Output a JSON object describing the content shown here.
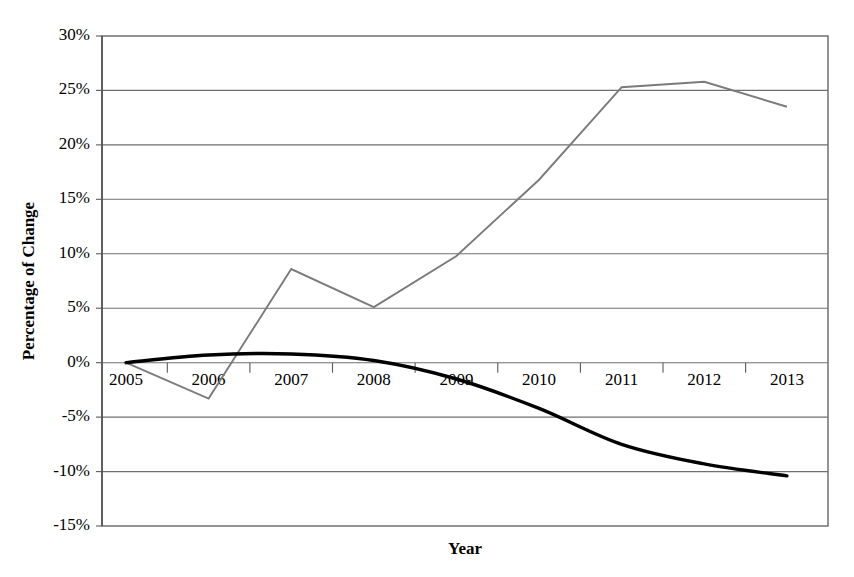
{
  "chart_data": {
    "type": "line",
    "title": "",
    "xlabel": "Year",
    "ylabel": "Percentage of Change",
    "categories": [
      "2005",
      "2006",
      "2007",
      "2008",
      "2009",
      "2010",
      "2011",
      "2012",
      "2013"
    ],
    "x": [
      2005,
      2006,
      2007,
      2008,
      2009,
      2010,
      2011,
      2012,
      2013
    ],
    "series": [
      {
        "name": "gray-series",
        "color": "#7b7b7b",
        "style": "straight",
        "values": [
          0.0,
          -3.3,
          8.6,
          5.1,
          9.8,
          16.8,
          25.3,
          25.8,
          23.5
        ]
      },
      {
        "name": "black-series",
        "color": "#000000",
        "style": "smoothed",
        "values": [
          0.0,
          0.7,
          0.8,
          0.2,
          -1.5,
          -4.2,
          -7.5,
          -9.3,
          -10.4
        ]
      }
    ],
    "ylim": [
      -15,
      30
    ],
    "ytick_values": [
      30,
      25,
      20,
      15,
      10,
      5,
      0,
      -5,
      -10,
      -15
    ],
    "ytick_labels": [
      "30%",
      "25%",
      "20%",
      "15%",
      "10%",
      "5%",
      "0%",
      "-5%",
      "-10%",
      "-15%"
    ],
    "xtick_labels": [
      "2005",
      "2006",
      "2007",
      "2008",
      "2009",
      "2010",
      "2011",
      "2012",
      "2013"
    ],
    "grid": true,
    "grid_axis": "y",
    "legend": "none",
    "legend_position": "none",
    "units": "percent"
  },
  "axes": {
    "y_title": "Percentage of Change",
    "x_title": "Year"
  },
  "ytick_labels": {
    "t0": "30%",
    "t1": "25%",
    "t2": "20%",
    "t3": "15%",
    "t4": "10%",
    "t5": "5%",
    "t6": "0%",
    "t7": "-5%",
    "t8": "-10%",
    "t9": "-15%"
  },
  "xtick_labels": {
    "t0": "2005",
    "t1": "2006",
    "t2": "2007",
    "t3": "2008",
    "t4": "2009",
    "t5": "2010",
    "t6": "2011",
    "t7": "2012",
    "t8": "2013"
  },
  "colors": {
    "gray_series": "#7b7b7b",
    "black_series": "#000000",
    "gridline": "#6f6f6f",
    "border": "#5a5a5a",
    "background": "#ffffff"
  }
}
